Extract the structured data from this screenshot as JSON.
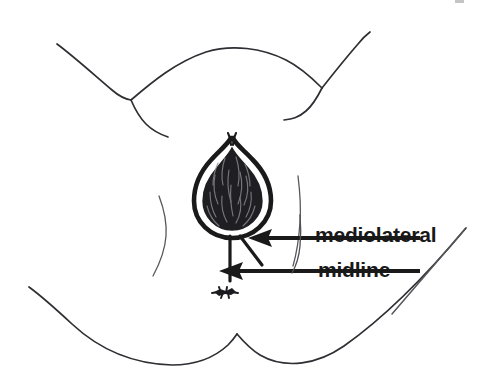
{
  "figure": {
    "kind": "medical-line-drawing",
    "background_color": "#ffffff",
    "ink_color": "#1a1a1a",
    "thin_line_color": "#55555a",
    "width": 494,
    "height": 385
  },
  "labels": {
    "mediolateral": "mediolateral",
    "midline": "midline"
  },
  "annotations": [
    {
      "name": "mediolateral-arrow",
      "label": "mediolateral",
      "points_to": "diagonal incision at lower-right of vaginal opening",
      "arrow_from_x": 420,
      "arrow_to_x": 252,
      "arrow_y": 238
    },
    {
      "name": "midline-arrow",
      "label": "midline",
      "points_to": "vertical incision below vaginal opening",
      "arrow_from_x": 420,
      "arrow_to_x": 222,
      "arrow_y": 271
    }
  ],
  "anatomy": [
    {
      "name": "vaginal-opening",
      "description": "dark pear/teardrop shaped filled opening with scribbled texture"
    },
    {
      "name": "midline-incision-line",
      "description": "short vertical line from base of opening"
    },
    {
      "name": "mediolateral-incision-line",
      "description": "short diagonal line from base of opening toward lower right"
    },
    {
      "name": "anus-mark",
      "description": "small dark starburst below the opening"
    },
    {
      "name": "left-labial-fold",
      "description": "thin curved line at left of opening"
    },
    {
      "name": "right-labial-fold",
      "description": "thin curved line at right of opening"
    },
    {
      "name": "upper-thigh-contours",
      "description": "two sweeping curves forming the upper groin creases"
    },
    {
      "name": "lower-buttock-contours",
      "description": "two sweeping curves forming the lower gluteal folds"
    }
  ]
}
